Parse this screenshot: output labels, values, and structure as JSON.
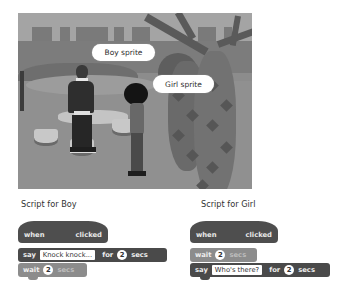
{
  "stage": {
    "callouts": {
      "boy": "Boy sprite",
      "girl": "Girl sprite"
    }
  },
  "scripts": {
    "boy": {
      "label": "Script for Boy",
      "hat": {
        "when": "when",
        "icon": "green-flag-icon",
        "clicked": "clicked"
      },
      "blocks": [
        {
          "type": "say",
          "say": "say",
          "message": "Knock knock...",
          "for": "for",
          "secs_value": "2",
          "secs": "secs"
        },
        {
          "type": "wait",
          "wait": "wait",
          "secs_value": "2",
          "secs": "secs"
        }
      ]
    },
    "girl": {
      "label": "Script for Girl",
      "hat": {
        "when": "when",
        "icon": "green-flag-icon",
        "clicked": "clicked"
      },
      "blocks": [
        {
          "type": "wait",
          "wait": "wait",
          "secs_value": "2",
          "secs": "secs"
        },
        {
          "type": "say",
          "say": "say",
          "message": "Who's there?",
          "for": "for",
          "secs_value": "2",
          "secs": "secs"
        }
      ]
    }
  },
  "colors": {
    "event_block": "#4e4e4e",
    "looks_block": "#4a4a4a",
    "control_block": "#8c8c8c"
  }
}
